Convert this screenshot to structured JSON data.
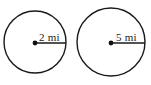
{
  "figure": {
    "background_color": "#ffffff",
    "stroke_color": "#1a1a1a",
    "text_color": "#1b1b1b",
    "dot_color": "#111111",
    "width": 151,
    "height": 85
  },
  "circles": [
    {
      "name": "left-circle",
      "label": "2 mi",
      "measure_value": "2",
      "measure_unit": "mi",
      "center_x": 35,
      "center_y": 42,
      "radius": 31,
      "stroke_width": 1.4,
      "dot_radius": 2.4,
      "radius_line": {
        "x1": 35,
        "y1": 43,
        "x2": 66,
        "y2": 43,
        "width": 1.5
      },
      "label_x": 39,
      "label_y": 41
    },
    {
      "name": "right-circle",
      "label": "5 mi",
      "measure_value": "5",
      "measure_unit": "mi",
      "center_x": 111,
      "center_y": 42,
      "radius": 34,
      "stroke_width": 1.4,
      "dot_radius": 2.4,
      "radius_line": {
        "x1": 111,
        "y1": 43,
        "x2": 145,
        "y2": 43,
        "width": 1.5
      },
      "label_x": 116,
      "label_y": 41
    }
  ]
}
